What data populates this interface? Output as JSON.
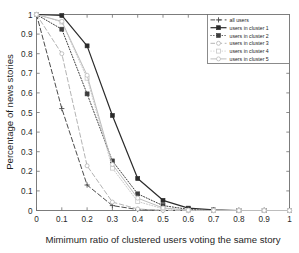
{
  "chart_data": {
    "type": "line",
    "title": "",
    "xlabel": "Mimimum ratio of clustered users voting the same story",
    "ylabel": "Percentage of news stories",
    "xlim": [
      0,
      1
    ],
    "ylim": [
      0,
      1
    ],
    "grid": false,
    "legend_position": "top-right",
    "xticks": [
      "0",
      "0.1",
      "0.2",
      "0.3",
      "0.4",
      "0.5",
      "0.6",
      "0.7",
      "0.8",
      "0.9",
      "1"
    ],
    "xtick_values": [
      0,
      0.1,
      0.2,
      0.3,
      0.4,
      0.5,
      0.6,
      0.7,
      0.8,
      0.9,
      1
    ],
    "yticks": [
      "0",
      "0.1",
      "0.2",
      "0.3",
      "0.4",
      "0.5",
      "0.6",
      "0.7",
      "0.8",
      "0.9",
      "1"
    ],
    "ytick_values": [
      0,
      0.1,
      0.2,
      0.3,
      0.4,
      0.5,
      0.6,
      0.7,
      0.8,
      0.9,
      1
    ],
    "x": [
      0,
      0.1,
      0.2,
      0.3,
      0.4,
      0.5,
      0.6,
      0.7,
      0.8,
      0.9,
      1
    ],
    "series": [
      {
        "name": "all users",
        "color": "#4a4a4a",
        "linestyle": "dashed",
        "marker": "plus",
        "values": [
          1.0,
          0.52,
          0.13,
          0.025,
          0.005,
          0.0,
          0.0,
          0.0,
          0.0,
          0.0,
          0.0
        ]
      },
      {
        "name": "users in cluster 1",
        "color": "#2b2b2b",
        "linestyle": "solid",
        "marker": "square-filled",
        "values": [
          1.0,
          0.995,
          0.84,
          0.485,
          0.163,
          0.052,
          0.012,
          0.003,
          0.0,
          0.0,
          0.0
        ]
      },
      {
        "name": "users in cluster 2",
        "color": "#3d3d3d",
        "linestyle": "dotted",
        "marker": "square-filled",
        "values": [
          1.0,
          0.925,
          0.595,
          0.253,
          0.085,
          0.025,
          0.006,
          0.0,
          0.0,
          0.0,
          0.0
        ]
      },
      {
        "name": "users in cluster 3",
        "color": "#b4b4b4",
        "linestyle": "dashed",
        "marker": "circle-open",
        "values": [
          1.0,
          0.8,
          0.228,
          0.043,
          0.008,
          0.0,
          0.0,
          0.0,
          0.0,
          0.0,
          0.0
        ]
      },
      {
        "name": "users in cluster 4",
        "color": "#c9c9c9",
        "linestyle": "dotted",
        "marker": "square-open",
        "values": [
          1.0,
          0.962,
          0.675,
          0.216,
          0.046,
          0.009,
          0.0,
          0.0,
          0.0,
          0.0,
          0.0
        ]
      },
      {
        "name": "users in cluster 5",
        "color": "#bdbdbd",
        "linestyle": "solid",
        "marker": "circle-open",
        "values": [
          1.0,
          0.965,
          0.69,
          0.235,
          0.063,
          0.013,
          0.002,
          0.0,
          0.0,
          0.0,
          0.0
        ]
      }
    ]
  },
  "axes": {
    "xlabel": "Mimimum ratio of clustered users voting the same story",
    "ylabel": "Percentage of news stories"
  },
  "legend": {
    "items": [
      {
        "label": "all users"
      },
      {
        "label": "users in cluster 1"
      },
      {
        "label": "users in cluster 2"
      },
      {
        "label": "users in cluster 3"
      },
      {
        "label": "users in cluster 4"
      },
      {
        "label": "users in cluster 5"
      }
    ]
  }
}
